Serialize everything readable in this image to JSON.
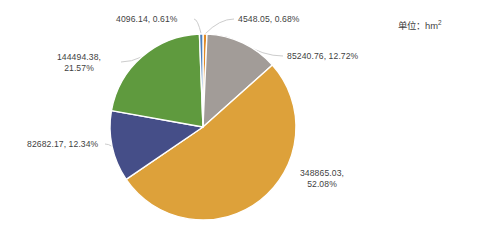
{
  "unit": {
    "prefix": "单位：hm",
    "exponent": "2"
  },
  "chart_data": {
    "type": "pie",
    "title": "",
    "xlabel": "",
    "ylabel": "",
    "unit": "hm2",
    "legend": "none",
    "grid": false,
    "total": 669926.53,
    "start_angle_deg": 0,
    "direction": "clockwise",
    "categories": [
      "4548.05",
      "85240.76",
      "348865.03",
      "82682.17",
      "144494.38",
      "4096.14"
    ],
    "values": [
      4548.05,
      85240.76,
      348865.03,
      82682.17,
      144494.38,
      4096.14
    ],
    "percents": [
      0.68,
      12.72,
      52.08,
      12.34,
      21.57,
      0.61
    ],
    "colors": [
      "#E08A26",
      "#A29C98",
      "#DDA13A",
      "#454E88",
      "#5F9A3E",
      "#4A7EBB"
    ],
    "slices": [
      {
        "value": "4548.05",
        "percent": "0.68%",
        "label": "4548.05, 0.68%",
        "color": "#E08A26",
        "label_x": 238,
        "label_y": 14,
        "align": "left",
        "lines": [
          "4548.05, 0.68%"
        ]
      },
      {
        "value": "85240.76",
        "percent": "12.72%",
        "label": "85240.76, 12.72%",
        "color": "#A29C98",
        "label_x": 287,
        "label_y": 51,
        "align": "left",
        "lines": [
          "85240.76, 12.72%"
        ]
      },
      {
        "value": "348865.03",
        "percent": "52.08%",
        "label": "348865.03, 52.08%",
        "color": "#DDA13A",
        "label_x": 322,
        "label_y": 168,
        "align": "center",
        "lines": [
          "348865.03,",
          "52.08%"
        ]
      },
      {
        "value": "82682.17",
        "percent": "12.34%",
        "label": "82682.17, 12.34%",
        "color": "#454E88",
        "label_x": 27,
        "label_y": 139,
        "align": "left",
        "lines": [
          "82682.17, 12.34%"
        ]
      },
      {
        "value": "144494.38",
        "percent": "21.57%",
        "label": "144494.38, 21.57%",
        "color": "#5F9A3E",
        "label_x": 79,
        "label_y": 52,
        "align": "center",
        "lines": [
          "144494.38,",
          "21.57%"
        ]
      },
      {
        "value": "4096.14",
        "percent": "0.61%",
        "label": "4096.14, 0.61%",
        "color": "#4A7EBB",
        "label_x": 116,
        "label_y": 14,
        "align": "left",
        "lines": [
          "4096.14, 0.61%"
        ]
      }
    ],
    "geometry": {
      "cx": 203,
      "cy": 127,
      "r": 93
    }
  }
}
